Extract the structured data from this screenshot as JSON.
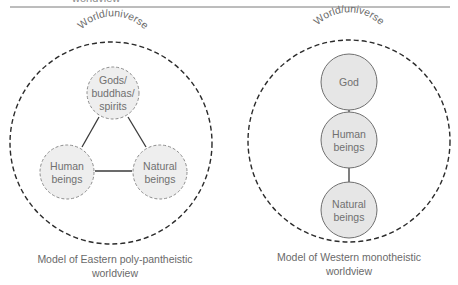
{
  "header": {
    "cut_text": "worldview",
    "rule_color": "#7a7a7a"
  },
  "colors": {
    "outer_border": "#2b2b2b",
    "eastern_node_fill": "#eeeeee",
    "eastern_node_border": "#8c8c8c",
    "western_node_fill": "#e6e6e6",
    "western_node_border": "#6f6f6f",
    "connector": "#3a3a3a",
    "text": "#6a6a6a"
  },
  "eastern": {
    "world_label": "World/universe",
    "nodes": [
      {
        "id": "gods",
        "lines": [
          "Gods/",
          "buddhas/",
          "spirits"
        ]
      },
      {
        "id": "human",
        "lines": [
          "Human",
          "beings"
        ]
      },
      {
        "id": "natural",
        "lines": [
          "Natural",
          "beings"
        ]
      }
    ],
    "caption": [
      "Model of Eastern poly-pantheistic",
      "worldview"
    ]
  },
  "western": {
    "world_label": "World/universe",
    "nodes": [
      {
        "id": "god",
        "lines": [
          "God"
        ]
      },
      {
        "id": "human",
        "lines": [
          "Human",
          "beings"
        ]
      },
      {
        "id": "natural",
        "lines": [
          "Natural",
          "beings"
        ]
      }
    ],
    "caption": [
      "Model of Western monotheistic",
      "worldview"
    ]
  }
}
